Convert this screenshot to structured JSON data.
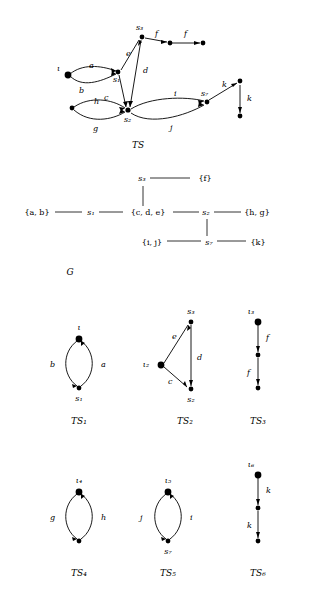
{
  "figure": {
    "captions": {
      "ts": "TS",
      "g": "G",
      "ts1": "TS₁",
      "ts2": "TS₂",
      "ts3": "TS₃",
      "ts4": "TS₄",
      "ts5": "TS₅",
      "ts6": "TS₆"
    }
  },
  "ts_diagram": {
    "state_labels": [
      "s₃",
      "s₁",
      "s₂",
      "s₇"
    ],
    "event_labels": [
      "ι",
      "a",
      "b",
      "c",
      "d",
      "e",
      "f",
      "f",
      "h",
      "g",
      "i",
      "j",
      "k",
      "k"
    ],
    "states": [
      {
        "name": "s3",
        "label": "s₃",
        "x": 142,
        "y": 36
      },
      {
        "name": "s1",
        "label": "s₁",
        "x": 118,
        "y": 72
      },
      {
        "name": "s2",
        "label": "s₂",
        "x": 128,
        "y": 111
      },
      {
        "name": "s7",
        "label": "s₇",
        "x": 207,
        "y": 102
      },
      {
        "name": "init",
        "label": "",
        "x": 68,
        "y": 74
      },
      {
        "name": "f1",
        "label": "",
        "x": 170,
        "y": 43
      },
      {
        "name": "f2",
        "label": "",
        "x": 203,
        "y": 43
      },
      {
        "name": "k1",
        "label": "",
        "x": 240,
        "y": 81
      },
      {
        "name": "k2",
        "label": "",
        "x": 240,
        "y": 116
      },
      {
        "name": "h1",
        "label": "",
        "x": 72,
        "y": 108
      }
    ],
    "edges": [
      {
        "from": "init",
        "to": "s1",
        "label": "a"
      },
      {
        "from": "init",
        "to": "s1",
        "label": "b"
      },
      {
        "from": "s1",
        "to": "s2",
        "label": "c"
      },
      {
        "from": "s1",
        "to": "s3",
        "label": "e"
      },
      {
        "from": "s3",
        "to": "s2",
        "label": "d"
      },
      {
        "from": "s3",
        "to": "f1",
        "label": "f"
      },
      {
        "from": "f1",
        "to": "f2",
        "label": "f"
      },
      {
        "from": "h1",
        "to": "s2",
        "label": "h"
      },
      {
        "from": "h1",
        "to": "s2",
        "label": "g"
      },
      {
        "from": "s2",
        "to": "s7",
        "label": "i"
      },
      {
        "from": "s2",
        "to": "s7",
        "label": "j"
      },
      {
        "from": "s7",
        "to": "k1",
        "label": "k"
      },
      {
        "from": "k1",
        "to": "k2",
        "label": "k"
      }
    ]
  },
  "g_diagram": {
    "nodes": [
      {
        "name": "s3",
        "label": "s₃",
        "x": 142,
        "y": 180
      },
      {
        "name": "f-set",
        "label": "{f}",
        "x": 205,
        "y": 180
      },
      {
        "name": "ab-set",
        "label": "{a, b}",
        "x": 37,
        "y": 214
      },
      {
        "name": "s1",
        "label": "s₁",
        "x": 91,
        "y": 214
      },
      {
        "name": "cde-set",
        "label": "{c, d, e}",
        "x": 147,
        "y": 214
      },
      {
        "name": "s2",
        "label": "s₂",
        "x": 206,
        "y": 214
      },
      {
        "name": "hg-set",
        "label": "{h, g}",
        "x": 257,
        "y": 214
      },
      {
        "name": "ij-set",
        "label": "{i, j}",
        "x": 152,
        "y": 243
      },
      {
        "name": "s7",
        "label": "s₇",
        "x": 209,
        "y": 243
      },
      {
        "name": "k-set",
        "label": "{k}",
        "x": 258,
        "y": 243
      }
    ],
    "edges": [
      {
        "from": "s3",
        "to": "f-set"
      },
      {
        "from": "s3",
        "to": "cde-set"
      },
      {
        "from": "ab-set",
        "to": "s1"
      },
      {
        "from": "s1",
        "to": "cde-set"
      },
      {
        "from": "cde-set",
        "to": "s2"
      },
      {
        "from": "s2",
        "to": "hg-set"
      },
      {
        "from": "s2",
        "to": "ij-set"
      },
      {
        "from": "ij-set",
        "to": "s7"
      },
      {
        "from": "s7",
        "to": "k-set"
      }
    ]
  },
  "components": [
    {
      "name": "TS1",
      "caption": "TS₁",
      "state_labels": [
        "ι",
        "s₁"
      ],
      "event_labels": [
        "b",
        "a"
      ]
    },
    {
      "name": "TS2",
      "caption": "TS₂",
      "state_labels": [
        "s₃",
        "ι₂",
        "s₂"
      ],
      "event_labels": [
        "e",
        "d",
        "c"
      ]
    },
    {
      "name": "TS3",
      "caption": "TS₃",
      "state_labels": [
        "ι₃"
      ],
      "event_labels": [
        "f",
        "f"
      ]
    },
    {
      "name": "TS4",
      "caption": "TS₄",
      "state_labels": [
        "ι₄"
      ],
      "event_labels": [
        "g",
        "h"
      ]
    },
    {
      "name": "TS5",
      "caption": "TS₅",
      "state_labels": [
        "ι₅",
        "s₇"
      ],
      "event_labels": [
        "j",
        "i"
      ]
    },
    {
      "name": "TS6",
      "caption": "TS₆",
      "state_labels": [
        "ι₆"
      ],
      "event_labels": [
        "k",
        "k"
      ]
    }
  ]
}
